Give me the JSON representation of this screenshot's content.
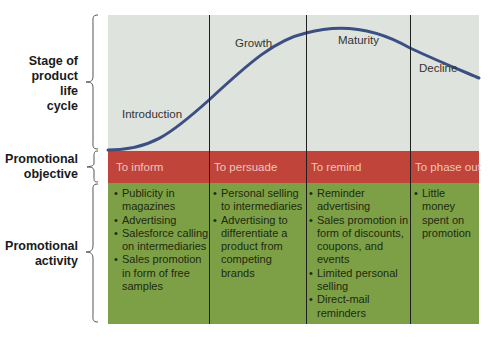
{
  "row_labels": {
    "stage": [
      "Stage of",
      "product",
      "life",
      "cycle"
    ],
    "objective": [
      "Promotional",
      "objective"
    ],
    "activity": [
      "Promotional",
      "activity"
    ]
  },
  "stages": [
    "Introduction",
    "Growth",
    "Maturity",
    "Decline"
  ],
  "objectives": [
    "To inform",
    "To persuade",
    "To remind",
    "To phase out"
  ],
  "activities": [
    [
      "Publicity in magazines",
      "Advertising",
      "Salesforce calling on intermediaries",
      "Sales promotion in form of free samples"
    ],
    [
      "Personal selling to intermediaries",
      "Advertising to differentiate a product from competing brands"
    ],
    [
      "Reminder advertising",
      "Sales promotion in form of discounts, coupons, and events",
      "Limited personal selling",
      "Direct-mail reminders"
    ],
    [
      "Little money spent on promotion"
    ]
  ],
  "colors": {
    "stage_bg": "#dfe3dd",
    "objective_bg": "#c0443a",
    "activity_bg": "#7da046",
    "curve": "#3b4f82"
  }
}
